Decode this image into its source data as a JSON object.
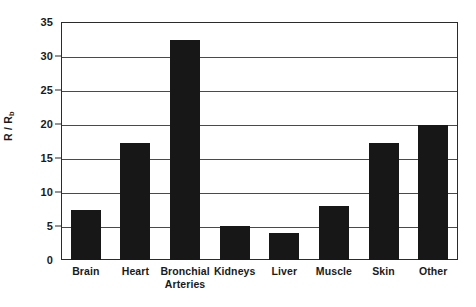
{
  "chart_data": {
    "type": "bar",
    "title": "",
    "subtitle": "",
    "xlabel": "",
    "ylabel": "R / R",
    "ylabel_subscript": "b",
    "categories": [
      "Brain",
      "Heart",
      "Bronchial Arteries",
      "Kidneys",
      "Liver",
      "Muscle",
      "Skin",
      "Other"
    ],
    "category_lines": [
      [
        "Brain"
      ],
      [
        "Heart"
      ],
      [
        "Bronchial",
        "Arteries"
      ],
      [
        "Kidneys"
      ],
      [
        "Liver"
      ],
      [
        "Muscle"
      ],
      [
        "Skin"
      ],
      [
        "Other"
      ]
    ],
    "values": [
      7.4,
      17.2,
      32.4,
      5.0,
      3.9,
      8.0,
      17.2,
      19.8
    ],
    "ylim": [
      0,
      35
    ],
    "yticks": [
      0,
      5,
      10,
      15,
      20,
      25,
      30,
      35
    ],
    "ytick_labels": [
      "0",
      "5",
      "10",
      "15",
      "20",
      "25",
      "30",
      "35"
    ],
    "grid": true,
    "grid_axis": "y",
    "legend": false,
    "legend_position": "none",
    "bar_color": "#171717",
    "axis_color": "#2b2b2b",
    "grid_color": "#4a4a4a",
    "background_color": "#ffffff",
    "text_color": "#1a1a1a"
  }
}
